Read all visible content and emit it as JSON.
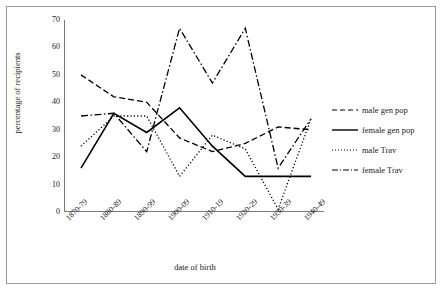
{
  "chart_data": {
    "type": "line",
    "title": "",
    "xlabel": "date of birth",
    "ylabel": "percentage of recipients",
    "categories": [
      "1870-79",
      "1880-89",
      "1890-99",
      "1900-09",
      "1910-19",
      "1920-29",
      "1930-39",
      "1940-49"
    ],
    "ylim": [
      0,
      70
    ],
    "yticks": [
      0,
      10,
      20,
      30,
      40,
      50,
      60,
      70
    ],
    "grid": false,
    "legend_position": "right",
    "series": [
      {
        "name": "male gen pop",
        "style": "dashed",
        "color": "#000000",
        "values": [
          50,
          42,
          40,
          27,
          22,
          25,
          31,
          30
        ]
      },
      {
        "name": "female gen pop",
        "style": "solid",
        "color": "#000000",
        "values": [
          16,
          36,
          29,
          38,
          24,
          13,
          13,
          13
        ]
      },
      {
        "name": "male Trav",
        "style": "dotted",
        "color": "#000000",
        "values": [
          24,
          35,
          35,
          13,
          28,
          23,
          1,
          34
        ]
      },
      {
        "name": "female Trav",
        "style": "dash-dot",
        "color": "#000000",
        "values": [
          35,
          36,
          22,
          67,
          47,
          67,
          16,
          34
        ]
      }
    ]
  },
  "legend": {
    "items": [
      {
        "label": "male gen pop"
      },
      {
        "label": "female gen pop"
      },
      {
        "label": "male Trav"
      },
      {
        "label": "female Trav"
      }
    ]
  }
}
